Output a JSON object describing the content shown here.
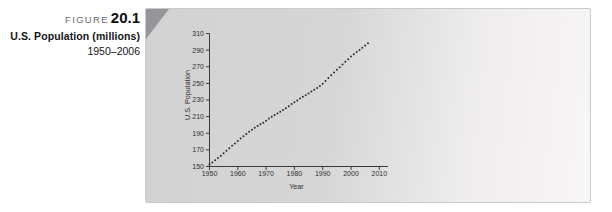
{
  "caption": {
    "figure_label": "FIGURE",
    "figure_number": "20.1",
    "title": "U.S. Population (millions)",
    "subtitle": "1950–2006"
  },
  "theme": {
    "panel_left": "#d2d2d2",
    "panel_right": "#f8f7f6",
    "tri": "#95969a",
    "text": "#151515",
    "figgray": "#67686b",
    "axis": "#3a3a3a",
    "marker": "#2d2d2d"
  },
  "chart_data": {
    "type": "scatter",
    "title": "",
    "xlabel": "Year",
    "ylabel": "U.S. Population",
    "xlim": [
      1950,
      2010
    ],
    "ylim": [
      150,
      310
    ],
    "grid": false,
    "legend": "none",
    "x_ticks": [
      1950,
      1960,
      1970,
      1980,
      1990,
      2000,
      2010
    ],
    "y_ticks": [
      150,
      170,
      190,
      210,
      230,
      250,
      270,
      290,
      310
    ],
    "x": [
      1950,
      1951,
      1952,
      1953,
      1954,
      1955,
      1956,
      1957,
      1958,
      1959,
      1960,
      1961,
      1962,
      1963,
      1964,
      1965,
      1966,
      1967,
      1968,
      1969,
      1970,
      1971,
      1972,
      1973,
      1974,
      1975,
      1976,
      1977,
      1978,
      1979,
      1980,
      1981,
      1982,
      1983,
      1984,
      1985,
      1986,
      1987,
      1988,
      1989,
      1990,
      1991,
      1992,
      1993,
      1994,
      1995,
      1996,
      1997,
      1998,
      1999,
      2000,
      2001,
      2002,
      2003,
      2004,
      2005,
      2006
    ],
    "values": [
      152.3,
      154.9,
      157.6,
      160.2,
      163.0,
      165.9,
      168.9,
      172.0,
      174.9,
      177.8,
      180.7,
      183.7,
      186.5,
      189.2,
      191.9,
      194.3,
      196.6,
      198.7,
      200.7,
      202.7,
      205.1,
      207.7,
      209.9,
      211.9,
      213.9,
      216.0,
      218.0,
      220.2,
      222.6,
      225.1,
      227.2,
      229.5,
      231.7,
      233.8,
      235.8,
      237.9,
      240.1,
      242.3,
      244.5,
      246.8,
      249.6,
      252.9,
      256.5,
      259.9,
      263.1,
      266.3,
      269.4,
      272.6,
      275.9,
      279.0,
      282.2,
      285.0,
      287.6,
      290.1,
      292.8,
      295.5,
      298.4
    ]
  }
}
